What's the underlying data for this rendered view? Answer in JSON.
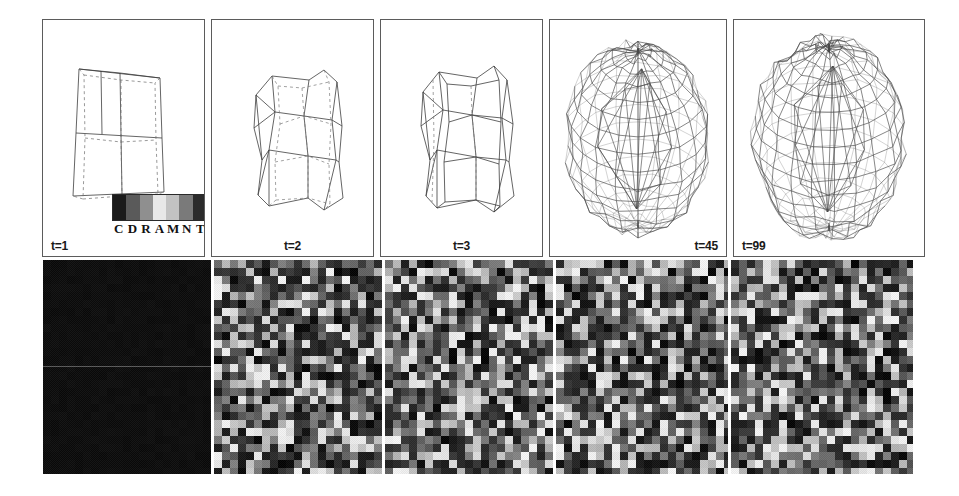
{
  "figure": {
    "layout": "two-row montage: top row 5 wireframe mesh renderings, bottom row 5 grayscale cellular-automaton rasters",
    "background_color": "#ffffff",
    "panel_border_color": "#5b5b5b"
  },
  "color_key": {
    "name": "cell-type-grayscale-key",
    "labels": [
      "C",
      "D",
      "R",
      "A",
      "M",
      "N",
      "T"
    ],
    "swatches": [
      "#1b1b1b",
      "#5a5a5a",
      "#8f8f8f",
      "#e8e8e8",
      "#c2c2c2",
      "#7a7a7a",
      "#2b2b2b"
    ]
  },
  "mesh_row": {
    "panels": [
      {
        "id": "mesh-t1",
        "time_label": "t=1",
        "label_align": "left",
        "mesh": "coarse-quad-shell",
        "complexity": 1
      },
      {
        "id": "mesh-t2",
        "time_label": "t=2",
        "label_align": "center",
        "mesh": "coarse-quad-shell",
        "complexity": 2
      },
      {
        "id": "mesh-t3",
        "time_label": "t=3",
        "label_align": "center",
        "mesh": "coarse-quad-shell",
        "complexity": 3
      },
      {
        "id": "mesh-t45",
        "time_label": "t=45",
        "label_align": "right",
        "mesh": "dense-sphere-shell",
        "complexity": 45
      },
      {
        "id": "mesh-t99",
        "time_label": "t=99",
        "label_align": "left",
        "mesh": "dense-sphere-shell",
        "complexity": 99
      }
    ]
  },
  "raster_row": {
    "panels": [
      {
        "id": "raster-t1",
        "state": "uniform-dark",
        "mean_gray": 22,
        "variance": 4,
        "seed": 11,
        "midline": true
      },
      {
        "id": "raster-t2",
        "state": "mixed-random",
        "mean_gray": 140,
        "variance": 95,
        "seed": 22,
        "midline": false
      },
      {
        "id": "raster-t3",
        "state": "mixed-random",
        "mean_gray": 138,
        "variance": 95,
        "seed": 33,
        "midline": false
      },
      {
        "id": "raster-t45",
        "state": "mixed-random",
        "mean_gray": 142,
        "variance": 95,
        "seed": 45,
        "midline": false
      },
      {
        "id": "raster-t99",
        "state": "mixed-random",
        "mean_gray": 141,
        "variance": 95,
        "seed": 99,
        "midline": false
      }
    ],
    "cell_size_px": 8,
    "columns": 21,
    "rows": 27
  },
  "chart_data": {
    "type": "heatmap",
    "title": "",
    "xlabel": "",
    "ylabel": "",
    "categories": [
      "t=1",
      "t=2",
      "t=3",
      "t=45",
      "t=99"
    ],
    "series": [
      {
        "name": "mesh vertices (relative)",
        "values": [
          1,
          2,
          3,
          45,
          99
        ]
      },
      {
        "name": "raster mean gray",
        "values": [
          22,
          140,
          138,
          142,
          141
        ]
      }
    ],
    "legend_entries": [
      "C",
      "D",
      "R",
      "A",
      "M",
      "N",
      "T"
    ],
    "grid": false,
    "legend_position": "inside-first-panel"
  }
}
